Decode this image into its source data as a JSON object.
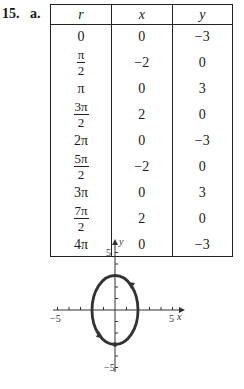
{
  "problem": {
    "number": "15.",
    "part": "a."
  },
  "table": {
    "headers": [
      "r",
      "x",
      "y"
    ],
    "rows": [
      {
        "r": "0",
        "r_num": "",
        "r_den": "",
        "x": "0",
        "y": "−3"
      },
      {
        "r": "",
        "r_num": "π",
        "r_den": "2",
        "x": "−2",
        "y": "0"
      },
      {
        "r": "π",
        "r_num": "",
        "r_den": "",
        "x": "0",
        "y": "3"
      },
      {
        "r": "",
        "r_num": "3π",
        "r_den": "2",
        "x": "2",
        "y": "0"
      },
      {
        "r": "2π",
        "r_num": "",
        "r_den": "",
        "x": "0",
        "y": "−3"
      },
      {
        "r": "",
        "r_num": "5π",
        "r_den": "2",
        "x": "−2",
        "y": "0"
      },
      {
        "r": "3π",
        "r_num": "",
        "r_den": "",
        "x": "0",
        "y": "3"
      },
      {
        "r": "",
        "r_num": "7π",
        "r_den": "2",
        "x": "2",
        "y": "0"
      },
      {
        "r": "4π",
        "r_num": "",
        "r_den": "",
        "x": "0",
        "y": "−3"
      }
    ]
  },
  "graph": {
    "x_axis_label": "x",
    "y_axis_label": "y",
    "x_tick_labels": {
      "min": "−5",
      "max": "5"
    },
    "y_tick_labels": {
      "min": "−5",
      "max": "5"
    }
  },
  "chart_data": {
    "type": "line",
    "title": "",
    "xlabel": "x",
    "ylabel": "y",
    "xlim": [
      -5,
      5
    ],
    "ylim": [
      -5,
      5
    ],
    "grid": false,
    "series": [
      {
        "name": "parametric ellipse x^2/4 + y^2/9 = 1",
        "x": [
          0,
          -2,
          0,
          2,
          0,
          -2,
          0,
          2,
          0
        ],
        "y": [
          -3,
          0,
          3,
          0,
          -3,
          0,
          3,
          0,
          -3
        ],
        "direction": "clockwise"
      }
    ],
    "annotations": [
      "direction arrows on curve (clockwise)",
      "point marked at (0,-3)"
    ]
  }
}
